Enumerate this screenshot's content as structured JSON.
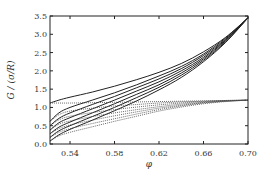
{
  "chart_data": {
    "type": "line",
    "title": "",
    "xlabel": "φ",
    "ylabel": "G / (σ/R)",
    "xlim": [
      0.522,
      0.7
    ],
    "ylim": [
      0.0,
      3.5
    ],
    "grid": false,
    "legend": null,
    "xticks": [
      0.54,
      0.58,
      0.62,
      0.66,
      0.7
    ],
    "xtick_labels": [
      "0.54",
      "0.58",
      "0.62",
      "0.66",
      "0.70"
    ],
    "yticks": [
      0.0,
      0.5,
      1.0,
      1.5,
      2.0,
      2.5,
      3.0,
      3.5
    ],
    "ytick_labels": [
      "0.0",
      "0.5",
      "1.0",
      "1.5",
      "2.0",
      "2.5",
      "3.0",
      "3.5"
    ],
    "x": [
      0.522,
      0.53,
      0.54,
      0.56,
      0.58,
      0.6,
      0.62,
      0.64,
      0.66,
      0.68,
      0.7
    ],
    "series": [
      {
        "name": "solid-1",
        "style": "solid",
        "values": [
          1.12,
          1.2,
          1.28,
          1.42,
          1.58,
          1.76,
          1.96,
          2.2,
          2.52,
          2.92,
          3.45
        ]
      },
      {
        "name": "solid-2",
        "style": "solid",
        "values": [
          0.62,
          0.85,
          1.0,
          1.2,
          1.4,
          1.62,
          1.86,
          2.12,
          2.46,
          2.9,
          3.45
        ]
      },
      {
        "name": "solid-3",
        "style": "solid",
        "values": [
          0.5,
          0.7,
          0.85,
          1.08,
          1.3,
          1.54,
          1.78,
          2.06,
          2.42,
          2.87,
          3.45
        ]
      },
      {
        "name": "solid-4",
        "style": "solid",
        "values": [
          0.38,
          0.58,
          0.72,
          0.96,
          1.2,
          1.45,
          1.7,
          2.0,
          2.37,
          2.85,
          3.45
        ]
      },
      {
        "name": "solid-5",
        "style": "solid",
        "values": [
          0.28,
          0.46,
          0.6,
          0.85,
          1.1,
          1.36,
          1.62,
          1.94,
          2.33,
          2.83,
          3.45
        ]
      },
      {
        "name": "solid-6",
        "style": "solid",
        "values": [
          0.18,
          0.36,
          0.5,
          0.75,
          1.0,
          1.27,
          1.55,
          1.88,
          2.29,
          2.8,
          3.45
        ]
      },
      {
        "name": "solid-7",
        "style": "solid",
        "values": [
          0.08,
          0.25,
          0.4,
          0.65,
          0.91,
          1.18,
          1.48,
          1.82,
          2.25,
          2.78,
          3.45
        ]
      },
      {
        "name": "dotted-1",
        "style": "dotted",
        "values": [
          1.12,
          1.12,
          1.12,
          1.13,
          1.14,
          1.15,
          1.16,
          1.17,
          1.18,
          1.19,
          1.2
        ]
      },
      {
        "name": "dotted-2",
        "style": "dotted",
        "values": [
          0.62,
          0.8,
          0.9,
          0.98,
          1.04,
          1.08,
          1.12,
          1.15,
          1.17,
          1.19,
          1.2
        ]
      },
      {
        "name": "dotted-3",
        "style": "dotted",
        "values": [
          0.5,
          0.66,
          0.76,
          0.86,
          0.94,
          1.01,
          1.07,
          1.12,
          1.16,
          1.18,
          1.2
        ]
      },
      {
        "name": "dotted-4",
        "style": "dotted",
        "values": [
          0.38,
          0.54,
          0.63,
          0.75,
          0.85,
          0.94,
          1.02,
          1.09,
          1.14,
          1.18,
          1.2
        ]
      },
      {
        "name": "dotted-5",
        "style": "dotted",
        "values": [
          0.28,
          0.42,
          0.52,
          0.65,
          0.77,
          0.88,
          0.98,
          1.06,
          1.13,
          1.17,
          1.2
        ]
      },
      {
        "name": "dotted-6",
        "style": "dotted",
        "values": [
          0.18,
          0.32,
          0.42,
          0.56,
          0.69,
          0.82,
          0.94,
          1.04,
          1.12,
          1.17,
          1.2
        ]
      },
      {
        "name": "dotted-7",
        "style": "dotted",
        "values": [
          0.08,
          0.22,
          0.32,
          0.47,
          0.62,
          0.76,
          0.9,
          1.01,
          1.1,
          1.16,
          1.2
        ]
      }
    ]
  },
  "plot": {
    "left": 50,
    "right": 248,
    "top": 16,
    "bottom": 144,
    "line_color": "#222222",
    "dotted_color": "#444444"
  }
}
